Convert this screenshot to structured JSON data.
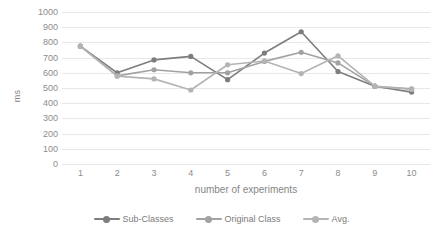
{
  "chart_data": {
    "type": "line",
    "title": "",
    "xlabel": "number of experiments",
    "ylabel": "ms",
    "categories": [
      "1",
      "2",
      "3",
      "4",
      "5",
      "6",
      "7",
      "8",
      "9",
      "10"
    ],
    "x": [
      1,
      2,
      3,
      4,
      5,
      6,
      7,
      8,
      9,
      10
    ],
    "ylim": [
      0,
      1000
    ],
    "yticks": [
      0,
      100,
      200,
      300,
      400,
      500,
      600,
      700,
      800,
      900,
      1000
    ],
    "ytick_labels": [
      "0",
      "100",
      "200",
      "300",
      "400",
      "500",
      "600",
      "700",
      "800",
      "900",
      "1000"
    ],
    "grid": true,
    "grid_axis": "y",
    "legend_position": "bottom",
    "series": [
      {
        "name": "Sub-Classes",
        "color": "#7d7d7d",
        "values": [
          775,
          600,
          685,
          708,
          555,
          730,
          870,
          608,
          512,
          473
        ]
      },
      {
        "name": "Original Class",
        "color": "#a2a2a2",
        "values": [
          775,
          580,
          620,
          600,
          600,
          675,
          735,
          665,
          512,
          495
        ]
      },
      {
        "name": "Avg.",
        "color": "#b4b4b4",
        "values": [
          775,
          578,
          560,
          487,
          653,
          678,
          595,
          712,
          512,
          490
        ]
      }
    ]
  },
  "colors": {
    "gridline": "#e8e8e8",
    "tick_text": "#8c8c8c",
    "axis_title": "#868686",
    "legend_text": "#7b7b7b",
    "background": "#ffffff"
  }
}
